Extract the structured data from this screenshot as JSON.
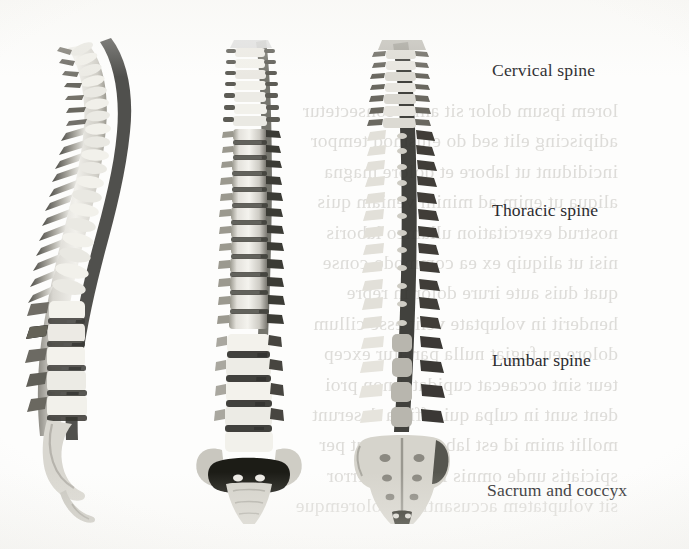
{
  "figure": {
    "kind": "anatomy-photograph-plate",
    "background_color": "#fdfdfc",
    "text_color": "#2b2b2e",
    "bone_light": "#efeee9",
    "bone_mid": "#b4b2ab",
    "bone_dark": "#4a4944",
    "bone_shadow": "#23221f"
  },
  "labels": [
    {
      "id": "cervical",
      "text": "Cervical spine",
      "x": 492,
      "y": 60
    },
    {
      "id": "thoracic",
      "text": "Thoracic spine",
      "x": 492,
      "y": 200
    },
    {
      "id": "lumbar",
      "text": "Lumbar spine",
      "x": 492,
      "y": 350
    },
    {
      "id": "sacral",
      "text": "Sacrum and coccyx",
      "x": 487,
      "y": 480
    }
  ],
  "specimens": [
    {
      "id": "lateral",
      "view": "lateral",
      "x": 16,
      "y": 26,
      "w": 180,
      "h": 498
    },
    {
      "id": "anterior",
      "view": "anterior",
      "x": 186,
      "y": 26,
      "w": 150,
      "h": 498
    },
    {
      "id": "posterior",
      "view": "posterior",
      "x": 330,
      "y": 26,
      "w": 160,
      "h": 498
    }
  ],
  "showthrough": {
    "visible": true,
    "note": "faint mirrored body text bleeding through the page from the reverse side",
    "lines": [
      "lorem ipsum dolor sit amet consectetur",
      "adipiscing elit sed do eiusmod tempor",
      "incididunt ut labore et dolore magna",
      "aliqua ut enim ad minim veniam quis",
      "nostrud exercitation ullamco laboris",
      "nisi ut aliquip ex ea commodo conse",
      "quat duis aute irure dolor in repre",
      "henderit in voluptate velit esse cillum",
      "dolore eu fugiat nulla pariatur excep",
      "teur sint occaecat cupidatat non proi",
      "dent sunt in culpa qui officia deserunt",
      "mollit anim id est laborum sed ut per",
      "spiciatis unde omnis iste natus error",
      "sit voluptatem accusantium doloremque"
    ]
  }
}
